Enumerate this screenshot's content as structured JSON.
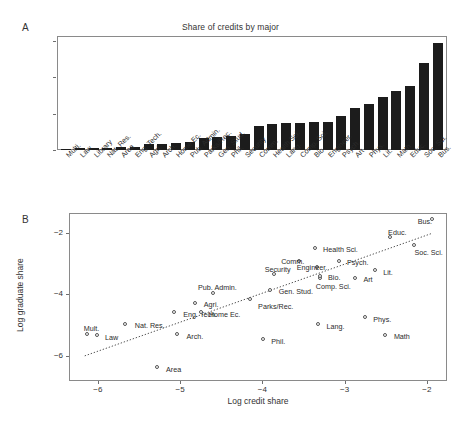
{
  "figure": {
    "panel_a_letter": "A",
    "panel_b_letter": "B"
  },
  "chart_data": [
    {
      "type": "bar",
      "panel": "A",
      "title": "Share of credits by major",
      "xlabel": "",
      "ylabel": "",
      "ylim": [
        0,
        0.155
      ],
      "yticks": [
        0,
        0.05,
        0.1,
        0.15
      ],
      "ytick_labels": [
        "0",
        "0.05",
        "0.1",
        "0.15"
      ],
      "grid": false,
      "bar_color": "#1c1c1c",
      "categories": [
        "Multi.",
        "Law",
        "Library",
        "Nat. Res.",
        "Area",
        "Eng. Tech.",
        "Agri.",
        "Arch.",
        "Home Ec.",
        "Pub. Admin.",
        "Parks/Rec.",
        "Gen. Stud.",
        "Phil.",
        "Security",
        "Comm.",
        "Health Sci.",
        "Lang.",
        "Comp. Sci.",
        "Bio.",
        "Engineer.",
        "Psych.",
        "Art",
        "Phys.",
        "Lit.",
        "Math",
        "Educ.",
        "Soc. Sci.",
        "Bus."
      ],
      "values": [
        0.0018,
        0.0026,
        0.0028,
        0.0031,
        0.0042,
        0.0044,
        0.0085,
        0.0086,
        0.0092,
        0.0113,
        0.0168,
        0.0181,
        0.0187,
        0.0219,
        0.0331,
        0.035,
        0.0366,
        0.0377,
        0.0386,
        0.0391,
        0.0468,
        0.0578,
        0.0627,
        0.0726,
        0.081,
        0.0881,
        0.1196,
        0.1462
      ]
    },
    {
      "type": "scatter",
      "panel": "B",
      "title": "",
      "xlabel": "Log credit share",
      "ylabel": "Log graduate share",
      "xlim": [
        -6.35,
        -1.78
      ],
      "ylim": [
        -6.75,
        -1.35
      ],
      "xticks": [
        -6,
        -5,
        -4,
        -3,
        -2
      ],
      "xtick_labels": [
        "−6",
        "−5",
        "−4",
        "−3",
        "−2"
      ],
      "yticks": [
        -2,
        -4,
        -6
      ],
      "ytick_labels": [
        "−2",
        "−4",
        "−6"
      ],
      "grid": false,
      "fit_line": {
        "style": "dotted",
        "x0": -6.17,
        "y0": -6.02,
        "x1": -1.92,
        "y1": -1.98
      },
      "marker": "open-circle",
      "points": [
        {
          "label": "Mult.",
          "x": -6.14,
          "y": -5.27,
          "lx": -6.22,
          "ly": -5.07,
          "anchor": "left"
        },
        {
          "label": "Law",
          "x": -6.02,
          "y": -5.3,
          "lx": -5.96,
          "ly": -5.35,
          "anchor": "left"
        },
        {
          "label": "Nat. Res.",
          "x": -5.67,
          "y": -4.93,
          "lx": -5.6,
          "ly": -4.97,
          "anchor": "left"
        },
        {
          "label": "Area",
          "x": -5.29,
          "y": -6.35,
          "lx": -5.22,
          "ly": -6.4,
          "anchor": "left"
        },
        {
          "label": "Arch.",
          "x": -5.04,
          "y": -5.28,
          "lx": -4.97,
          "ly": -5.32,
          "anchor": "left"
        },
        {
          "label": "Eng. Tech.",
          "x": -5.08,
          "y": -4.55,
          "lx": -5.01,
          "ly": -4.59,
          "anchor": "left"
        },
        {
          "label": "Agri.",
          "x": -4.83,
          "y": -4.25,
          "lx": -4.76,
          "ly": -4.29,
          "anchor": "left"
        },
        {
          "label": "Home Ec.",
          "x": -4.75,
          "y": -4.55,
          "lx": -4.7,
          "ly": -4.59,
          "anchor": "left"
        },
        {
          "label": "Pub. Admin.",
          "x": -4.6,
          "y": -3.94,
          "lx": -4.83,
          "ly": -3.72,
          "anchor": "left"
        },
        {
          "label": "Parks/Rec.",
          "x": -4.16,
          "y": -4.12,
          "lx": -4.1,
          "ly": -4.35,
          "anchor": "left"
        },
        {
          "label": "Gen. Stud.",
          "x": -3.91,
          "y": -3.83,
          "lx": -3.85,
          "ly": -3.87,
          "anchor": "left"
        },
        {
          "label": "Phil.",
          "x": -4.0,
          "y": -5.43,
          "lx": -3.94,
          "ly": -5.47,
          "anchor": "left"
        },
        {
          "label": "Security",
          "x": -3.87,
          "y": -3.32,
          "lx": -4.02,
          "ly": -3.13,
          "anchor": "left"
        },
        {
          "label": "Comm.",
          "x": -3.56,
          "y": -2.89,
          "lx": -3.82,
          "ly": -2.89,
          "anchor": "left"
        },
        {
          "label": "Health Sci.",
          "x": -3.37,
          "y": -2.46,
          "lx": -3.31,
          "ly": -2.5,
          "anchor": "left"
        },
        {
          "label": "Engineer.",
          "x": -3.34,
          "y": -3.09,
          "lx": -3.63,
          "ly": -3.08,
          "anchor": "left"
        },
        {
          "label": "Comp. Sci.",
          "x": -3.3,
          "y": -3.45,
          "lx": -3.4,
          "ly": -3.68,
          "anchor": "left"
        },
        {
          "label": "Bio.",
          "x": -3.3,
          "y": -3.37,
          "lx": -3.25,
          "ly": -3.41,
          "anchor": "left"
        },
        {
          "label": "Lang.",
          "x": -3.33,
          "y": -4.94,
          "lx": -3.27,
          "ly": -4.98,
          "anchor": "left"
        },
        {
          "label": "Psych.",
          "x": -3.08,
          "y": -2.88,
          "lx": -3.02,
          "ly": -2.92,
          "anchor": "left"
        },
        {
          "label": "Art",
          "x": -2.88,
          "y": -3.44,
          "lx": -2.82,
          "ly": -3.48,
          "anchor": "left"
        },
        {
          "label": "Phys.",
          "x": -2.76,
          "y": -4.72,
          "lx": -2.7,
          "ly": -4.76,
          "anchor": "left"
        },
        {
          "label": "Lit.",
          "x": -2.64,
          "y": -3.19,
          "lx": -2.58,
          "ly": -3.23,
          "anchor": "left"
        },
        {
          "label": "Math",
          "x": -2.51,
          "y": -5.29,
          "lx": -2.45,
          "ly": -5.33,
          "anchor": "left"
        },
        {
          "label": "Educ.",
          "x": -2.45,
          "y": -2.12,
          "lx": -2.52,
          "ly": -1.92,
          "anchor": "left"
        },
        {
          "label": "Soc. Sci.",
          "x": -2.16,
          "y": -2.37,
          "lx": -2.2,
          "ly": -2.58,
          "anchor": "left"
        },
        {
          "label": "Bus.",
          "x": -1.95,
          "y": -1.54,
          "lx": -2.16,
          "ly": -1.58,
          "anchor": "left"
        }
      ]
    }
  ]
}
